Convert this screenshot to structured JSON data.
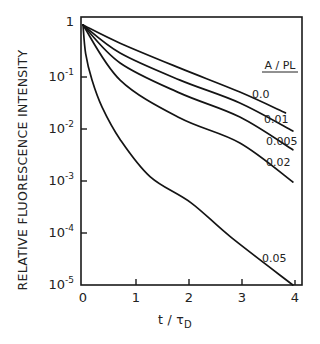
{
  "chart_data": {
    "type": "line",
    "title": "",
    "xlabel": "t / τ_D",
    "xlabel_main": "t / τ",
    "xlabel_sub": "D",
    "ylabel": "RELATIVE FLUORESCENCE INTENSITY",
    "yscale": "log",
    "xlim": [
      0,
      4
    ],
    "ylim": [
      1e-05,
      1
    ],
    "grid": false,
    "x_ticks": [
      {
        "value": 0,
        "label": "0"
      },
      {
        "value": 1,
        "label": "1"
      },
      {
        "value": 2,
        "label": "2"
      },
      {
        "value": 3,
        "label": "3"
      },
      {
        "value": 4,
        "label": "4"
      }
    ],
    "y_ticks": [
      {
        "value": 1,
        "base": "1",
        "exp": ""
      },
      {
        "value": 0.1,
        "base": "10",
        "exp": "-1"
      },
      {
        "value": 0.01,
        "base": "10",
        "exp": "-2"
      },
      {
        "value": 0.001,
        "base": "10",
        "exp": "-3"
      },
      {
        "value": 0.0001,
        "base": "10",
        "exp": "-4"
      },
      {
        "value": 1e-05,
        "base": "10",
        "exp": "-5"
      }
    ],
    "legend": {
      "title": "A / PL",
      "position": "right, inline labels at curve ends"
    },
    "series": [
      {
        "name": "0.0",
        "x": [
          0,
          0.7,
          1.83,
          2.96,
          3.82
        ],
        "log10_y": [
          0,
          -0.35,
          -0.83,
          -1.29,
          -1.69
        ],
        "label_pos": [
          252,
          98
        ]
      },
      {
        "name": "0.01",
        "x": [
          0,
          0.7,
          1.83,
          2.96,
          3.96
        ],
        "log10_y": [
          0,
          -0.54,
          -1.06,
          -1.5,
          -2.04
        ],
        "label_pos": [
          264,
          123
        ]
      },
      {
        "name": "0.005",
        "x": [
          0,
          0.7,
          1.83,
          2.96,
          3.96
        ],
        "log10_y": [
          0,
          -0.73,
          -1.31,
          -1.77,
          -2.4
        ],
        "label_pos": [
          266,
          145
        ]
      },
      {
        "name": "0.02",
        "x": [
          0,
          0.7,
          1.83,
          2.96,
          3.96
        ],
        "log10_y": [
          0,
          -1.06,
          -1.79,
          -2.27,
          -3.02
        ],
        "label_pos": [
          266,
          166
        ]
      },
      {
        "name": "0.05",
        "x": [
          0,
          0.05,
          0.17,
          0.36,
          0.7,
          1.27,
          2.04,
          2.79,
          3.96
        ],
        "log10_y": [
          0,
          -0.55,
          -1.06,
          -1.58,
          -2.2,
          -2.92,
          -3.42,
          -4.08,
          -5.0
        ],
        "label_pos": [
          262,
          262
        ]
      }
    ]
  }
}
